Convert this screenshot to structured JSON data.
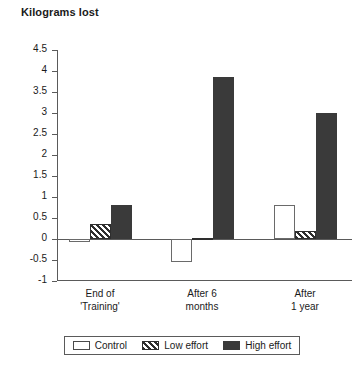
{
  "chart_data": {
    "type": "bar",
    "title": "Kilograms lost",
    "xlabel": "",
    "ylabel": "",
    "ylim": [
      -1,
      4.5
    ],
    "yticks": [
      4.5,
      4,
      3.5,
      3,
      2.5,
      2,
      1.5,
      1,
      0.5,
      0,
      -0.5,
      -1
    ],
    "ytick_labels": [
      "4.5",
      "4",
      "3.5",
      "3",
      "2.5",
      "2",
      "1.5",
      "1",
      "0.5",
      "0",
      "-0.5",
      "-1"
    ],
    "grid": false,
    "legend_position": "bottom",
    "categories": [
      "End of 'Training'",
      "After 6 months",
      "After 1 year"
    ],
    "category_lines": [
      [
        "End of",
        "'Training'"
      ],
      [
        "After 6",
        "months"
      ],
      [
        "After",
        "1 year"
      ]
    ],
    "series": [
      {
        "name": "Control",
        "values": [
          -0.08,
          -0.55,
          0.8
        ],
        "color": "#ffffff",
        "pattern": "solid"
      },
      {
        "name": "Low effort",
        "values": [
          0.36,
          0.02,
          0.2
        ],
        "color": "#2e2e2e",
        "pattern": "hatch"
      },
      {
        "name": "High effort",
        "values": [
          0.8,
          3.85,
          3.0
        ],
        "color": "#3a3a3a",
        "pattern": "solid"
      }
    ]
  },
  "legend": {
    "items": [
      {
        "label": "Control"
      },
      {
        "label": "Low effort"
      },
      {
        "label": "High effort"
      }
    ]
  }
}
